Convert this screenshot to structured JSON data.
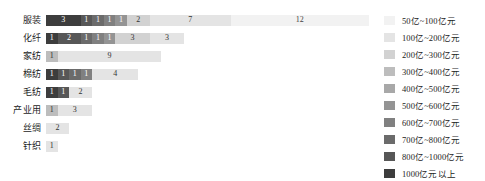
{
  "chart_data": {
    "type": "bar",
    "orientation": "horizontal",
    "stacked": true,
    "title": "",
    "subtitle": "",
    "xlabel": "",
    "ylabel": "",
    "grid": false,
    "legend_position": "right",
    "axis_max_units": 28,
    "categories": [
      "服装",
      "化纤",
      "家纺",
      "棉纺",
      "毛纺",
      "产业用",
      "丝绸",
      "针织"
    ],
    "legend_entries": [
      {
        "label": "50亿~100亿元",
        "color": "#f2f2f2"
      },
      {
        "label": "100亿~200亿元",
        "color": "#e4e4e4"
      },
      {
        "label": "200亿~300亿元",
        "color": "#d2d2d2"
      },
      {
        "label": "300亿~400亿元",
        "color": "#bdbdbd"
      },
      {
        "label": "400亿~500亿元",
        "color": "#a8a8a8"
      },
      {
        "label": "500亿~600亿元",
        "color": "#949494"
      },
      {
        "label": "600亿~700亿元",
        "color": "#808080"
      },
      {
        "label": "700亿~800亿元",
        "color": "#6b6b6b"
      },
      {
        "label": "800亿~1000亿元",
        "color": "#575757"
      },
      {
        "label": "1000亿元以上",
        "color": "#3d3d3d"
      }
    ],
    "series": [
      {
        "name": "1000亿元以上",
        "color": "#3d3d3d",
        "text_color": "#ffffff",
        "values": [
          3,
          1,
          0,
          1,
          1,
          0,
          0,
          0
        ]
      },
      {
        "name": "800亿~1000亿元",
        "color": "#575757",
        "text_color": "#ffffff",
        "values": [
          1,
          2,
          0,
          1,
          1,
          0,
          0,
          0
        ]
      },
      {
        "name": "700亿~800亿元",
        "color": "#6b6b6b",
        "text_color": "#ffffff",
        "values": [
          1,
          1,
          0,
          1,
          0,
          0,
          0,
          0
        ]
      },
      {
        "name": "600亿~700亿元",
        "color": "#808080",
        "text_color": "#ffffff",
        "values": [
          1,
          1,
          0,
          1,
          0,
          0,
          0,
          0
        ]
      },
      {
        "name": "500亿~600亿元",
        "color": "#949494",
        "text_color": "#ffffff",
        "values": [
          1,
          1,
          0,
          0,
          0,
          0,
          0,
          0
        ]
      },
      {
        "name": "400亿~500亿元",
        "color": "#a8a8a8",
        "text_color": "#ffffff",
        "values": [
          0,
          0,
          0,
          0,
          0,
          0,
          0,
          0
        ]
      },
      {
        "name": "300亿~400亿元",
        "color": "#bdbdbd",
        "text_color": "#333333",
        "values": [
          0,
          0,
          1,
          0,
          0,
          1,
          0,
          0
        ]
      },
      {
        "name": "200亿~300亿元",
        "color": "#d2d2d2",
        "text_color": "#333333",
        "values": [
          2,
          3,
          0,
          0,
          0,
          0,
          0,
          0
        ]
      },
      {
        "name": "100亿~200亿元",
        "color": "#e4e4e4",
        "text_color": "#333333",
        "values": [
          7,
          3,
          9,
          4,
          2,
          3,
          2,
          1
        ]
      },
      {
        "name": "50亿~100亿元",
        "color": "#f2f2f2",
        "text_color": "#444444",
        "values": [
          12,
          0,
          0,
          0,
          0,
          0,
          0,
          0
        ]
      }
    ],
    "row_totals": [
      28,
      12,
      10,
      8,
      4,
      4,
      2,
      1
    ]
  }
}
